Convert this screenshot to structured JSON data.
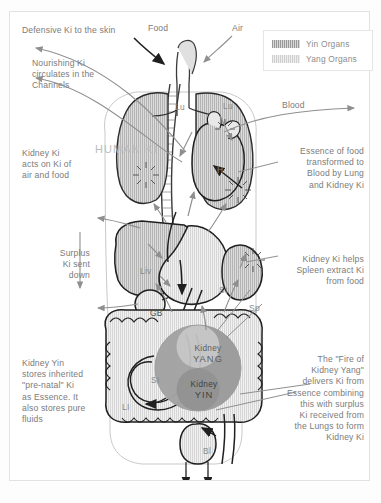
{
  "diagram": {
    "central_label": "HUMAN KI"
  },
  "legend": {
    "items": [
      {
        "label": "Yin Organs",
        "swatch": "yin",
        "color": "#9a9a9a"
      },
      {
        "label": "Yang Organs",
        "swatch": "yang",
        "color": "#cfcfcf"
      }
    ]
  },
  "inputs": [
    {
      "name": "food",
      "label": "Food"
    },
    {
      "name": "air",
      "label": "Air"
    }
  ],
  "captions": {
    "defensive_ki": "Defensive Ki to the skin",
    "nourishing_ki": "Nourishing Ki\ncirculates in the\nChannels",
    "kidney_ki_acts": "Kidney Ki\nacts on Ki of\nair and food",
    "surplus_ki": "Surplus\nKi sent\ndown",
    "kidney_yin": "Kidney Yin\nstores inherited\n\"pre-natal\" Ki\nas Essence. It\nalso stores pure\nfluids",
    "blood": "Blood",
    "essence_of_food": "Essence of food\ntransformed to\nBlood by Lung\nand Kidney Ki",
    "spleen_extract": "Kidney Ki helps\nSpleen extract Ki\nfrom food",
    "fire_of_kidney_yang": "The \"Fire of\nKidney Yang\"\ndelivers Ki from\nEssence combining\nthis with surplus\nKi received from\nthe Lungs to form\nKidney Ki"
  },
  "organs": [
    {
      "id": "lung_left",
      "label": "Lu",
      "type": "yin"
    },
    {
      "id": "lung_right",
      "label": "Lu",
      "type": "yin"
    },
    {
      "id": "heart",
      "label": "H",
      "type": "yin"
    },
    {
      "id": "liver",
      "label": "Liv",
      "type": "yin"
    },
    {
      "id": "gallbladder",
      "label": "GB",
      "type": "yang"
    },
    {
      "id": "stomach",
      "label": "St",
      "type": "yang"
    },
    {
      "id": "spleen",
      "label": "Sp",
      "type": "yin"
    },
    {
      "id": "small_intestine",
      "label": "SI",
      "type": "yang"
    },
    {
      "id": "large_intestine",
      "label": "LI",
      "type": "yang"
    },
    {
      "id": "bladder",
      "label": "Bl",
      "type": "yang"
    }
  ],
  "kidney": {
    "yang_line1": "Kidney",
    "yang_line2": "YANG",
    "yin_line1": "Kidney",
    "yin_line2": "YIN"
  },
  "colors": {
    "yin_fill": "#9a9a9a",
    "yang_fill": "#d8d8d8",
    "ink": "#6f6f6f",
    "arrow_grey": "#8f8f8f",
    "arrow_dark": "#1f1f1f"
  }
}
